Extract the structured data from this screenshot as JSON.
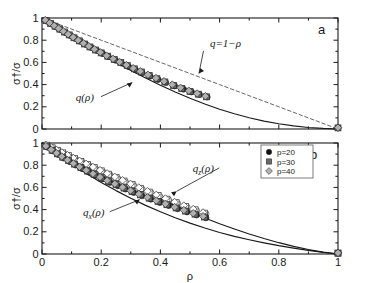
{
  "figure": {
    "caption_letters": {
      "panel_a": "a",
      "panel_b": "b"
    },
    "background": "#ffffff",
    "frame_color": "#1a1a1a"
  },
  "axes": {
    "x": {
      "label": "ρ",
      "ticks": [
        "0",
        "0.2",
        "0.4",
        "0.6",
        "0.8",
        "1"
      ],
      "tick_values": [
        0,
        0.2,
        0.4,
        0.6,
        0.8,
        1
      ],
      "range": [
        0,
        1
      ]
    },
    "y": {
      "label": "σ†/σ",
      "ticks": [
        "0",
        "0.2",
        "0.4",
        "0.6",
        "0.8",
        "1"
      ],
      "tick_values": [
        0,
        0.2,
        0.4,
        0.6,
        0.8,
        1
      ],
      "range": [
        0,
        1
      ]
    }
  },
  "legend": {
    "position": "top-right-panel-b",
    "entries": [
      {
        "label": "p=20",
        "marker": "circle",
        "color": "#111111",
        "fill": "#111111"
      },
      {
        "label": "p=30",
        "marker": "square",
        "color": "#6b6b6b",
        "fill": "#6b6b6b"
      },
      {
        "label": "p=40",
        "marker": "diamond",
        "color": "#b4b4b4",
        "fill": "#b4b4b4"
      }
    ]
  },
  "annotations": {
    "panel_a": [
      {
        "text": "q=1−ρ",
        "x": 0.62,
        "y": 0.74,
        "arrow_to": [
          0.53,
          0.5
        ]
      },
      {
        "text": "q(ρ)",
        "x": 0.145,
        "y": 0.255,
        "arrow_to": [
          0.305,
          0.42
        ]
      }
    ],
    "panel_b": [
      {
        "text": "q_z(ρ)",
        "display": "q",
        "sub": "z",
        "suffix": "(ρ)",
        "x": 0.545,
        "y": 0.74,
        "arrow_to": [
          0.455,
          0.565
        ]
      },
      {
        "text": "q_x(ρ)",
        "display": "q",
        "sub": "x",
        "suffix": "(ρ)",
        "x": 0.175,
        "y": 0.345,
        "arrow_to": [
          0.33,
          0.49
        ]
      }
    ]
  },
  "chart_data": [
    {
      "type": "scatter",
      "panel": "a",
      "title": "",
      "xlabel": "ρ",
      "ylabel": "σ†/σ",
      "xlim": [
        0,
        1
      ],
      "ylim": [
        0,
        1
      ],
      "grid": false,
      "lines": [
        {
          "name": "q=1−ρ",
          "style": "dashed",
          "color": "#555555",
          "x": [
            0,
            0.2,
            0.4,
            0.6,
            0.8,
            1
          ],
          "y": [
            1,
            0.8,
            0.6,
            0.4,
            0.2,
            0
          ]
        },
        {
          "name": "q(ρ)",
          "style": "solid",
          "color": "#1a1a1a",
          "x": [
            0,
            0.05,
            0.1,
            0.15,
            0.2,
            0.25,
            0.3,
            0.35,
            0.4,
            0.45,
            0.5,
            0.55,
            0.6,
            0.65,
            0.7,
            0.75,
            0.8,
            0.85,
            0.9,
            0.95,
            1
          ],
          "y": [
            1,
            0.915,
            0.832,
            0.752,
            0.674,
            0.6,
            0.528,
            0.46,
            0.395,
            0.334,
            0.277,
            0.225,
            0.178,
            0.137,
            0.101,
            0.071,
            0.047,
            0.028,
            0.014,
            0.005,
            0
          ]
        }
      ],
      "series": [
        {
          "name": "p=20",
          "marker": "circle",
          "color": "#111111",
          "x": [
            0.018,
            0.032,
            0.048,
            0.062,
            0.079,
            0.095,
            0.112,
            0.129,
            0.148,
            0.166,
            0.185,
            0.205,
            0.224,
            0.248,
            0.268,
            0.292,
            0.315,
            0.338,
            0.365,
            0.392,
            0.418,
            0.448,
            0.478,
            0.505,
            0.532,
            0.558,
            1.0
          ],
          "y": [
            0.97,
            0.946,
            0.919,
            0.896,
            0.868,
            0.842,
            0.816,
            0.79,
            0.761,
            0.734,
            0.707,
            0.679,
            0.652,
            0.62,
            0.594,
            0.563,
            0.534,
            0.507,
            0.476,
            0.446,
            0.418,
            0.388,
            0.359,
            0.334,
            0.31,
            0.288,
            0.01
          ]
        },
        {
          "name": "p=30",
          "marker": "square",
          "color": "#6b6b6b",
          "x": [
            0.014,
            0.029,
            0.044,
            0.06,
            0.076,
            0.092,
            0.108,
            0.126,
            0.144,
            0.162,
            0.181,
            0.2,
            0.222,
            0.244,
            0.266,
            0.288,
            0.312,
            0.336,
            0.362,
            0.388,
            0.415,
            0.444,
            0.472,
            0.5,
            0.528,
            0.556,
            1.0
          ],
          "y": [
            0.976,
            0.951,
            0.926,
            0.9,
            0.874,
            0.848,
            0.822,
            0.794,
            0.766,
            0.739,
            0.712,
            0.686,
            0.656,
            0.627,
            0.599,
            0.571,
            0.542,
            0.514,
            0.483,
            0.453,
            0.424,
            0.393,
            0.365,
            0.339,
            0.314,
            0.29,
            0.01
          ]
        },
        {
          "name": "p=40",
          "marker": "diamond",
          "color": "#b4b4b4",
          "x": [
            0.011,
            0.026,
            0.041,
            0.056,
            0.072,
            0.088,
            0.105,
            0.122,
            0.14,
            0.158,
            0.177,
            0.197,
            0.218,
            0.24,
            0.262,
            0.285,
            0.308,
            0.332,
            0.358,
            0.385,
            0.412,
            0.44,
            0.468,
            0.496,
            0.524,
            0.552,
            1.0
          ],
          "y": [
            0.981,
            0.956,
            0.931,
            0.906,
            0.88,
            0.854,
            0.827,
            0.8,
            0.772,
            0.745,
            0.718,
            0.691,
            0.661,
            0.632,
            0.604,
            0.576,
            0.548,
            0.52,
            0.489,
            0.459,
            0.43,
            0.4,
            0.372,
            0.345,
            0.32,
            0.296,
            0.012
          ]
        }
      ]
    },
    {
      "type": "scatter",
      "panel": "b",
      "title": "",
      "xlabel": "ρ",
      "ylabel": "σ†/σ",
      "xlim": [
        0,
        1
      ],
      "ylim": [
        0,
        1
      ],
      "grid": false,
      "lines": [
        {
          "name": "q_z(ρ)",
          "style": "solid",
          "color": "#1a1a1a",
          "x": [
            0,
            0.05,
            0.1,
            0.15,
            0.2,
            0.25,
            0.3,
            0.35,
            0.4,
            0.45,
            0.5,
            0.55,
            0.6,
            0.65,
            0.7,
            0.75,
            0.8,
            0.85,
            0.9,
            0.95,
            1
          ],
          "y": [
            1,
            0.936,
            0.872,
            0.808,
            0.744,
            0.681,
            0.618,
            0.556,
            0.495,
            0.436,
            0.379,
            0.325,
            0.273,
            0.225,
            0.18,
            0.139,
            0.102,
            0.069,
            0.04,
            0.017,
            0
          ]
        },
        {
          "name": "q_x(ρ)",
          "style": "solid",
          "color": "#1a1a1a",
          "x": [
            0,
            0.05,
            0.1,
            0.15,
            0.2,
            0.25,
            0.3,
            0.35,
            0.4,
            0.45,
            0.5,
            0.55,
            0.6,
            0.65,
            0.7,
            0.75,
            0.8,
            0.85,
            0.9,
            0.95,
            1
          ],
          "y": [
            1,
            0.902,
            0.81,
            0.725,
            0.645,
            0.571,
            0.502,
            0.438,
            0.38,
            0.327,
            0.278,
            0.234,
            0.194,
            0.159,
            0.128,
            0.1,
            0.075,
            0.053,
            0.033,
            0.015,
            0
          ]
        }
      ],
      "series": [
        {
          "name": "p=20 upper (q_z)",
          "branch": "z",
          "marker": "circle-open",
          "color": "#111111",
          "x": [
            0.02,
            0.038,
            0.055,
            0.074,
            0.094,
            0.114,
            0.136,
            0.158,
            0.18,
            0.205,
            0.23,
            0.256,
            0.282,
            0.31,
            0.338,
            0.368,
            0.398,
            0.428,
            0.458,
            0.49,
            0.522,
            0.554,
            1.0
          ],
          "y": [
            0.976,
            0.952,
            0.93,
            0.906,
            0.88,
            0.855,
            0.828,
            0.8,
            0.773,
            0.742,
            0.712,
            0.681,
            0.65,
            0.617,
            0.585,
            0.552,
            0.519,
            0.487,
            0.456,
            0.423,
            0.392,
            0.362,
            0.008
          ]
        },
        {
          "name": "p=30 upper (q_z)",
          "branch": "z",
          "marker": "square-open",
          "color": "#6b6b6b",
          "x": [
            0.016,
            0.034,
            0.052,
            0.07,
            0.09,
            0.11,
            0.131,
            0.153,
            0.176,
            0.2,
            0.225,
            0.25,
            0.277,
            0.304,
            0.332,
            0.362,
            0.392,
            0.422,
            0.453,
            0.485,
            0.517,
            0.549,
            1.0
          ],
          "y": [
            0.98,
            0.957,
            0.934,
            0.911,
            0.886,
            0.861,
            0.834,
            0.807,
            0.779,
            0.749,
            0.719,
            0.689,
            0.657,
            0.625,
            0.592,
            0.558,
            0.526,
            0.494,
            0.462,
            0.429,
            0.398,
            0.368,
            0.008
          ]
        },
        {
          "name": "p=40 upper (q_z)",
          "branch": "z",
          "marker": "diamond-open",
          "color": "#b4b4b4",
          "x": [
            0.013,
            0.031,
            0.049,
            0.067,
            0.086,
            0.106,
            0.127,
            0.149,
            0.172,
            0.196,
            0.22,
            0.246,
            0.272,
            0.299,
            0.327,
            0.356,
            0.386,
            0.417,
            0.448,
            0.479,
            0.511,
            0.544,
            1.0
          ],
          "y": [
            0.984,
            0.961,
            0.938,
            0.915,
            0.891,
            0.865,
            0.839,
            0.812,
            0.784,
            0.755,
            0.726,
            0.695,
            0.664,
            0.632,
            0.599,
            0.566,
            0.533,
            0.5,
            0.468,
            0.436,
            0.405,
            0.374,
            0.01
          ]
        },
        {
          "name": "p=20 lower (q_x)",
          "branch": "x",
          "marker": "circle",
          "color": "#111111",
          "x": [
            0.02,
            0.038,
            0.055,
            0.074,
            0.094,
            0.114,
            0.136,
            0.158,
            0.18,
            0.205,
            0.23,
            0.256,
            0.282,
            0.31,
            0.338,
            0.368,
            0.398,
            0.428,
            0.458,
            0.49,
            0.522,
            0.554,
            1.0
          ],
          "y": [
            0.961,
            0.927,
            0.896,
            0.864,
            0.832,
            0.801,
            0.769,
            0.738,
            0.708,
            0.676,
            0.645,
            0.615,
            0.585,
            0.554,
            0.524,
            0.494,
            0.464,
            0.436,
            0.408,
            0.379,
            0.352,
            0.326,
            0.008
          ]
        },
        {
          "name": "p=30 lower (q_x)",
          "branch": "x",
          "marker": "square",
          "color": "#6b6b6b",
          "x": [
            0.016,
            0.034,
            0.052,
            0.07,
            0.09,
            0.11,
            0.131,
            0.153,
            0.176,
            0.2,
            0.225,
            0.25,
            0.277,
            0.304,
            0.332,
            0.362,
            0.392,
            0.422,
            0.453,
            0.485,
            0.517,
            0.549,
            1.0
          ],
          "y": [
            0.967,
            0.934,
            0.903,
            0.872,
            0.841,
            0.81,
            0.778,
            0.747,
            0.717,
            0.686,
            0.655,
            0.625,
            0.594,
            0.563,
            0.533,
            0.503,
            0.473,
            0.444,
            0.415,
            0.387,
            0.359,
            0.333,
            0.008
          ]
        },
        {
          "name": "p=40 lower (q_x)",
          "branch": "x",
          "marker": "diamond",
          "color": "#b4b4b4",
          "x": [
            0.013,
            0.031,
            0.049,
            0.067,
            0.086,
            0.106,
            0.127,
            0.149,
            0.172,
            0.196,
            0.22,
            0.246,
            0.272,
            0.299,
            0.327,
            0.356,
            0.386,
            0.417,
            0.448,
            0.479,
            0.511,
            0.544,
            1.0
          ],
          "y": [
            0.972,
            0.94,
            0.909,
            0.878,
            0.847,
            0.816,
            0.785,
            0.754,
            0.724,
            0.693,
            0.662,
            0.632,
            0.601,
            0.571,
            0.541,
            0.511,
            0.481,
            0.452,
            0.423,
            0.395,
            0.367,
            0.34,
            0.01
          ]
        }
      ]
    }
  ]
}
